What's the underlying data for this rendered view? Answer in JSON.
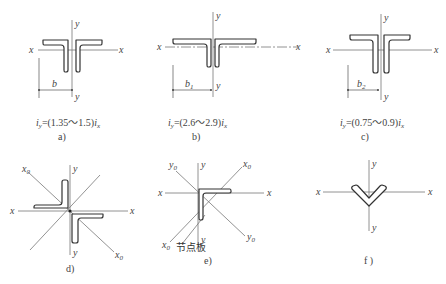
{
  "figure": {
    "panels": [
      {
        "id": "a",
        "caption": "a)",
        "description": "Double angle, unequal legs, short legs joined (T-shape)",
        "axis_labels": {
          "x_left": "x",
          "x_right": "x",
          "y_top": "y",
          "y_bottom": "y"
        },
        "dimension": {
          "symbol": "b",
          "subscript": ""
        },
        "formula": {
          "lhs": "i",
          "lhs_sub": "y",
          "eq": "=(1.35～1.5)",
          "rhs": "i",
          "rhs_sub": "x"
        }
      },
      {
        "id": "b",
        "caption": "b)",
        "description": "Double angle, unequal legs, long legs horizontal",
        "axis_labels": {
          "x_left": "x",
          "x_right": "x",
          "y_top": "y",
          "y_bottom": "y"
        },
        "dimension": {
          "symbol": "b",
          "subscript": "1"
        },
        "formula": {
          "lhs": "i",
          "lhs_sub": "y",
          "eq": "=(2.6～2.9)",
          "rhs": "i",
          "rhs_sub": "x"
        }
      },
      {
        "id": "c",
        "caption": "c)",
        "description": "Double angle, unequal legs, long legs vertical",
        "axis_labels": {
          "x_left": "x",
          "x_right": "x",
          "y_top": "y",
          "y_bottom": "y"
        },
        "dimension": {
          "symbol": "b",
          "subscript": "2"
        },
        "formula": {
          "lhs": "i",
          "lhs_sub": "y",
          "eq": "=(0.75～0.9)",
          "rhs": "i",
          "rhs_sub": "x"
        }
      },
      {
        "id": "d",
        "caption": "d)",
        "description": "Double angle in cross (star) arrangement",
        "axis_labels": {
          "x_left": "x",
          "x_right": "x",
          "y_top": "y",
          "y_bottom": "y",
          "x0_top": "x",
          "x0_bottom": "x",
          "x0_sub": "0"
        }
      },
      {
        "id": "e",
        "caption": "e)",
        "description": "Single angle on gusset plate",
        "axis_labels": {
          "x_left": "x",
          "x_right": "x",
          "y_top": "y",
          "y_bottom": "y",
          "x0_top": "x",
          "x0_bottom": "x",
          "y0_top": "y",
          "y0_bottom": "y",
          "sub0": "0"
        },
        "annotation": "节点板"
      },
      {
        "id": "f",
        "caption": "f )",
        "description": "Single angle, V orientation",
        "axis_labels": {
          "x_left": "x",
          "x_right": "x",
          "y_top": "y",
          "y_bottom": "y"
        }
      }
    ]
  }
}
